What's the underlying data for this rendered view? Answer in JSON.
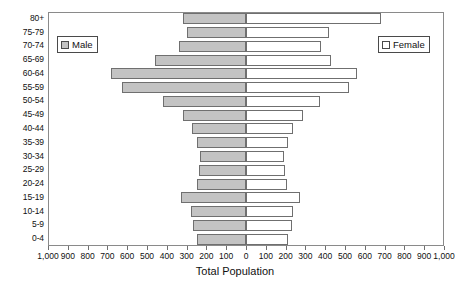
{
  "chart_data": {
    "type": "bar",
    "subtype": "population-pyramid",
    "title": "",
    "xlabel": "Total Population",
    "ylabel": "",
    "categories": [
      "0-4",
      "5-9",
      "10-14",
      "15-19",
      "20-24",
      "25-29",
      "30-34",
      "35-39",
      "40-44",
      "45-49",
      "50-54",
      "55-59",
      "60-64",
      "65-69",
      "70-74",
      "75-79",
      "80+"
    ],
    "series": [
      {
        "name": "Male",
        "direction": "left",
        "color": "#c3c3c3",
        "values": [
          250,
          270,
          280,
          330,
          250,
          235,
          230,
          250,
          275,
          320,
          420,
          625,
          680,
          460,
          340,
          300,
          320
        ]
      },
      {
        "name": "Female",
        "direction": "right",
        "color": "#ffffff",
        "values": [
          210,
          230,
          235,
          275,
          205,
          195,
          190,
          210,
          235,
          290,
          375,
          520,
          560,
          430,
          380,
          420,
          680
        ]
      }
    ],
    "xlim": [
      -1000,
      1000
    ],
    "xticks": [
      -1000,
      -900,
      -800,
      -700,
      -600,
      -500,
      -400,
      -300,
      -200,
      -100,
      0,
      100,
      200,
      300,
      400,
      500,
      600,
      700,
      800,
      900,
      1000
    ],
    "xtick_labels": [
      "1,000",
      "900",
      "800",
      "700",
      "600",
      "500",
      "400",
      "300",
      "200",
      "100",
      "0",
      "100",
      "200",
      "300",
      "400",
      "500",
      "600",
      "700",
      "800",
      "900",
      "1,000"
    ],
    "grid": false,
    "legend": [
      {
        "label": "Male",
        "position": "top-left"
      },
      {
        "label": "Female",
        "position": "top-right"
      }
    ]
  }
}
